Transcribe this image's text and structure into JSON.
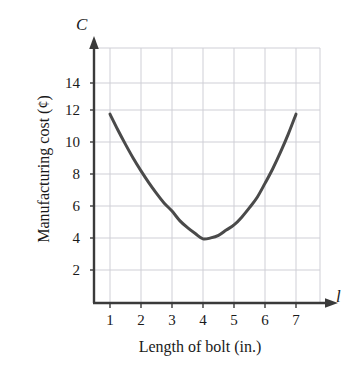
{
  "chart_data": {
    "type": "line",
    "title": "",
    "subtitle": "",
    "xlabel": "Length of bolt (in.)",
    "ylabel": "Manufacturing cost (¢)",
    "x_axis_symbol": "l",
    "y_axis_symbol": "C",
    "xlim": [
      0,
      7.6
    ],
    "ylim": [
      0,
      15.2
    ],
    "xticks": [
      1,
      2,
      3,
      4,
      5,
      6,
      7
    ],
    "xtick_labels": [
      "1",
      "2",
      "3",
      "4",
      "5",
      "6",
      "7"
    ],
    "yticks": [
      2,
      4,
      6,
      8,
      10,
      12,
      14
    ],
    "ytick_labels": [
      "2",
      "4",
      "6",
      "8",
      "10",
      "12",
      "14"
    ],
    "grid": true,
    "grid_color": "#cfcfd6",
    "legend": null,
    "legend_position": "none",
    "axis_arrows": true,
    "series": [
      {
        "name": "Manufacturing cost",
        "color": "#4a4a4a",
        "line_width": 3,
        "x": [
          1.0,
          1.25,
          1.5,
          1.75,
          2.0,
          2.25,
          2.5,
          2.75,
          3.0,
          3.25,
          3.5,
          3.75,
          4.0,
          4.25,
          4.5,
          4.75,
          5.0,
          5.25,
          5.5,
          5.75,
          6.0,
          6.25,
          6.5,
          6.75,
          7.0
        ],
        "y": [
          12.0,
          11.0,
          10.06,
          9.17,
          8.36,
          7.61,
          6.92,
          6.29,
          5.78,
          5.17,
          4.72,
          4.34,
          4.0,
          4.06,
          4.22,
          4.56,
          4.89,
          5.39,
          6.0,
          6.67,
          7.56,
          8.5,
          9.56,
          10.72,
          12.0
        ]
      }
    ],
    "vertex": {
      "x": 4,
      "y": 4
    },
    "endpoints": [
      {
        "x": 1,
        "y": 12
      },
      {
        "x": 7,
        "y": 12
      }
    ],
    "equation": "C = (8/9)(l - 4)^2 + 4"
  }
}
